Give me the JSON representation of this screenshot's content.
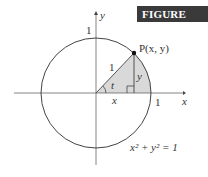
{
  "figure_label": "Figure 8.33",
  "figure_label_display": "FIGURE 8.33",
  "labels": {
    "y_axis": "y",
    "x_axis": "x",
    "top_intercept": "1",
    "right_intercept": "1",
    "point": "P(x, y)",
    "hypotenuse": "1",
    "vertical_leg": "y",
    "horizontal_leg": "x",
    "angle": "t",
    "equation": "x² + y² = 1"
  },
  "colors": {
    "shade": "#d9d9d9",
    "stroke": "#444444",
    "badge_bg": "#3a3a3a"
  }
}
